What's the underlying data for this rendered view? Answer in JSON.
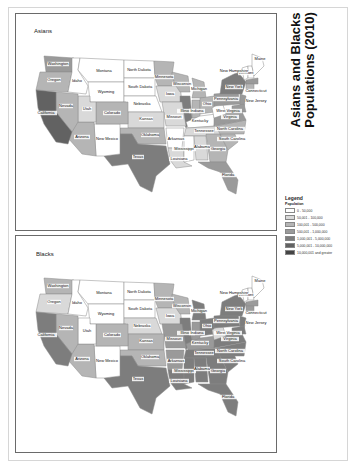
{
  "title": "Asians and Blacks Populations (2010)",
  "title_lines": [
    "Asians and Blacks",
    "Populations (2010)"
  ],
  "legend": {
    "title": "Legend",
    "subtitle": "Population",
    "classes": [
      {
        "label": "0 - 50,000",
        "color": "#ffffff"
      },
      {
        "label": "50,001 - 100,000",
        "color": "#d9d9d9"
      },
      {
        "label": "100,001 - 500,000",
        "color": "#b5b5b5"
      },
      {
        "label": "500,001 - 1,000,000",
        "color": "#9a9a9a"
      },
      {
        "label": "1,000,001 - 5,000,000",
        "color": "#7d7d7d"
      },
      {
        "label": "5,000,001 - 10,000,000",
        "color": "#626262"
      },
      {
        "label": "10,000,001 and greater",
        "color": "#444444"
      }
    ]
  },
  "maps": [
    {
      "title": "Asians",
      "states": {
        "Washington": 3,
        "Oregon": 2,
        "Idaho": 0,
        "Montana": 0,
        "Wyoming": 0,
        "North Dakota": 0,
        "South Dakota": 0,
        "Nebraska": 0,
        "Minnesota": 2,
        "Iowa": 1,
        "Wisconsin": 2,
        "Michigan": 2,
        "Illinois": 4,
        "Indiana": 2,
        "Ohio": 2,
        "Kentucky": 0,
        "Tennessee": 1,
        "Missouri": 1,
        "Kansas": 1,
        "Oklahoma": 2,
        "Texas": 4,
        "New Mexico": 0,
        "Arizona": 2,
        "Colorado": 2,
        "Utah": 1,
        "Nevada": 2,
        "California": 5,
        "Arkansas": 0,
        "Louisiana": 1,
        "Mississippi": 0,
        "Alabama": 1,
        "Georgia": 2,
        "Florida": 3,
        "South Carolina": 2,
        "North Carolina": 2,
        "Virginia": 3,
        "West Virginia": 0,
        "Pennsylvania": 3,
        "New York": 4,
        "New Jersey": 3,
        "Vermont": 0,
        "New Hampshire": 0,
        "Maine": 0,
        "Massachusetts": 3,
        "Connecticut": 2,
        "Maryland": 3
      }
    },
    {
      "title": "Blacks",
      "states": {
        "Washington": 2,
        "Oregon": 1,
        "Idaho": 0,
        "Montana": 0,
        "Wyoming": 0,
        "North Dakota": 0,
        "South Dakota": 0,
        "Nebraska": 1,
        "Minnesota": 2,
        "Iowa": 1,
        "Wisconsin": 2,
        "Michigan": 4,
        "Illinois": 4,
        "Indiana": 3,
        "Ohio": 4,
        "Kentucky": 3,
        "Tennessee": 4,
        "Missouri": 3,
        "Kansas": 2,
        "Oklahoma": 2,
        "Texas": 4,
        "New Mexico": 0,
        "Arizona": 2,
        "Colorado": 2,
        "Utah": 0,
        "Nevada": 2,
        "California": 4,
        "Arkansas": 3,
        "Louisiana": 4,
        "Mississippi": 4,
        "Alabama": 4,
        "Georgia": 4,
        "Florida": 4,
        "South Carolina": 4,
        "North Carolina": 4,
        "Virginia": 4,
        "West Virginia": 1,
        "Pennsylvania": 4,
        "New York": 4,
        "New Jersey": 4,
        "Vermont": 0,
        "New Hampshire": 0,
        "Maine": 0,
        "Massachusetts": 3,
        "Connecticut": 3,
        "Maryland": 4
      }
    }
  ],
  "labels": {
    "Washington": "Washington",
    "Oregon": "Oregon",
    "Idaho": "Idaho",
    "Montana": "Montana",
    "Wyoming": "Wyoming",
    "North Dakota": "North Dakota",
    "South Dakota": "South Dakota",
    "Nebraska": "Nebraska",
    "Minnesota": "Minnesota",
    "Iowa": "Iowa",
    "Wisconsin": "Wisconsin",
    "Michigan": "Michigan",
    "Illinois": "Illinois",
    "Indiana": "Indiana",
    "Ohio": "Ohio",
    "Kentucky": "Kentucky",
    "Tennessee": "Tennessee",
    "Missouri": "Missouri",
    "Kansas": "Kansas",
    "Oklahoma": "Oklahoma",
    "Texas": "Texas",
    "New Mexico": "New Mexico",
    "Arizona": "Arizona",
    "Colorado": "Colorado",
    "Utah": "Utah",
    "Nevada": "Nevada",
    "California": "California",
    "Arkansas": "Arkansas",
    "Louisiana": "Louisiana",
    "Mississippi": "Mississippi",
    "Alabama": "Alabama",
    "Georgia": "Georgia",
    "Florida": "Florida",
    "South Carolina": "South Carolina",
    "North Carolina": "North Carolina",
    "Virginia": "Virginia",
    "West Virginia": "West Virginia",
    "Pennsylvania": "Pennsylvania",
    "New York": "New York",
    "New Jersey": "New Jersey",
    "Vermont": "Vermont",
    "New Hampshire": "New Hampshire",
    "Maine": "Maine",
    "Connecticut": "Connecticut"
  }
}
